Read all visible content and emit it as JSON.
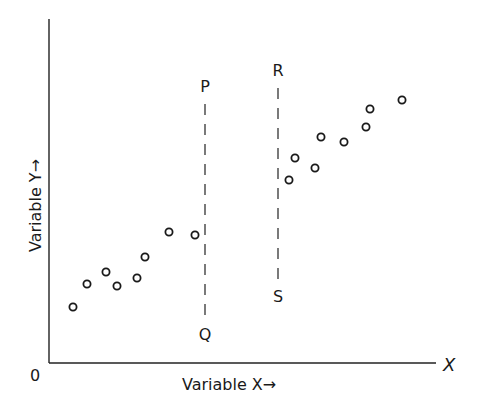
{
  "chart_data": {
    "type": "scatter",
    "title": "",
    "xlabel": "Variable X→",
    "ylabel": "Variable Y→",
    "origin_label": "0",
    "x_axis_end_label": "X",
    "grid": false,
    "legend": null,
    "axes": {
      "origin_px": [
        49,
        363
      ],
      "x_end_px": 436,
      "y_top_px": 19
    },
    "series": [
      {
        "name": "left cluster",
        "points_px": [
          [
            73,
            307
          ],
          [
            87,
            284
          ],
          [
            106,
            272
          ],
          [
            117,
            286
          ],
          [
            137,
            278
          ],
          [
            145,
            257
          ],
          [
            169,
            232
          ],
          [
            195,
            235
          ]
        ]
      },
      {
        "name": "right cluster",
        "points_px": [
          [
            289,
            180
          ],
          [
            295,
            158
          ],
          [
            315,
            168
          ],
          [
            321,
            137
          ],
          [
            344,
            142
          ],
          [
            366,
            127
          ],
          [
            370,
            109
          ],
          [
            402,
            100
          ]
        ]
      }
    ],
    "reference_lines": [
      {
        "name": "PQ",
        "top_label": "P",
        "bottom_label": "Q",
        "x_px": 205,
        "y1_px": 104,
        "y2_px": 318,
        "style": "dashed"
      },
      {
        "name": "RS",
        "top_label": "R",
        "bottom_label": "S",
        "x_px": 278,
        "y1_px": 88,
        "y2_px": 280,
        "style": "dashed"
      }
    ]
  }
}
